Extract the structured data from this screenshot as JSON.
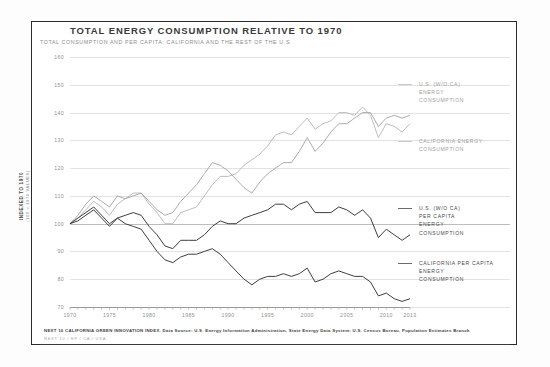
{
  "chart_data": {
    "type": "line",
    "title": "TOTAL ENERGY CONSUMPTION RELATIVE TO 1970",
    "subtitle": "TOTAL CONSUMPTION AND PER CAPITA: CALIFORNIA AND THE REST OF THE U.S.",
    "xlabel": "",
    "ylabel": "INDEXED TO 1970",
    "ylabel_sub": "(100 = 1970 VALUES)",
    "grid": true,
    "legend_position": "right",
    "xlim": [
      1970,
      2013
    ],
    "ylim": [
      70,
      160
    ],
    "yticks": [
      160,
      150,
      140,
      130,
      120,
      110,
      100,
      90,
      80,
      70
    ],
    "xticks": [
      1970,
      1975,
      1980,
      1985,
      1990,
      1995,
      2000,
      2005,
      2010,
      2013
    ],
    "x": [
      1970,
      1971,
      1972,
      1973,
      1974,
      1975,
      1976,
      1977,
      1978,
      1979,
      1980,
      1981,
      1982,
      1983,
      1984,
      1985,
      1986,
      1987,
      1988,
      1989,
      1990,
      1991,
      1992,
      1993,
      1994,
      1995,
      1996,
      1997,
      1998,
      1999,
      2000,
      2001,
      2002,
      2003,
      2004,
      2005,
      2006,
      2007,
      2008,
      2009,
      2010,
      2011,
      2012,
      2013
    ],
    "series": [
      {
        "name": "U.S. (W/O CA) ENERGY CONSUMPTION",
        "color": "#b5b5b5",
        "values": [
          100,
          102,
          105,
          108,
          106,
          103,
          107,
          109,
          111,
          111,
          107,
          104,
          100,
          100,
          104,
          105,
          106,
          110,
          114,
          117,
          117,
          118,
          121,
          123,
          125,
          128,
          132,
          133,
          132,
          135,
          138,
          134,
          136,
          137,
          140,
          140,
          139,
          142,
          139,
          131,
          136,
          135,
          133,
          136
        ]
      },
      {
        "name": "CALIFORNIA ENERGY CONSUMPTION",
        "color": "#a3a3a3",
        "values": [
          100,
          103,
          107,
          110,
          108,
          106,
          110,
          109,
          110,
          111,
          108,
          105,
          103,
          104,
          108,
          111,
          114,
          118,
          122,
          121,
          119,
          116,
          113,
          111,
          115,
          118,
          120,
          122,
          122,
          126,
          131,
          126,
          129,
          133,
          136,
          136,
          138,
          140,
          140,
          135,
          138,
          139,
          138,
          139
        ]
      },
      {
        "name": "U.S. (W/O CA) PER CAPITA ENERGY CONSUMPTION",
        "color": "#3e3e3e",
        "values": [
          100,
          101,
          103,
          105,
          102,
          99,
          102,
          103,
          104,
          103,
          99,
          96,
          92,
          91,
          94,
          94,
          94,
          96,
          99,
          101,
          100,
          100,
          102,
          103,
          104,
          105,
          107,
          107,
          105,
          107,
          108,
          104,
          104,
          104,
          106,
          105,
          103,
          105,
          102,
          95,
          98,
          96,
          94,
          96
        ]
      },
      {
        "name": "CALIFORNIA PER CAPITA ENERGY CONSUMPTION",
        "color": "#3e3e3e",
        "values": [
          100,
          102,
          104,
          106,
          103,
          100,
          102,
          100,
          99,
          98,
          94,
          90,
          87,
          86,
          88,
          89,
          89,
          90,
          91,
          89,
          86,
          83,
          80,
          78,
          80,
          81,
          81,
          82,
          81,
          82,
          84,
          79,
          80,
          82,
          83,
          82,
          81,
          81,
          79,
          74,
          75,
          73,
          72,
          73
        ]
      }
    ],
    "annotations": [
      {
        "text": "U.S. (W/O CA)\nENERGY\nCONSUMPTION",
        "tone": "light"
      },
      {
        "text": "CALIFORNIA ENERGY\nCONSUMPTION",
        "tone": "light"
      },
      {
        "text": "U.S. (W/O CA)\nPER CAPITA\nENERGY\nCONSUMPTION",
        "tone": "dark"
      },
      {
        "text": "CALIFORNIA PER CAPITA\nENERGY\nCONSUMPTION",
        "tone": "dark"
      }
    ]
  },
  "footer": {
    "source": "NEXT 10 CALIFORNIA GREEN INNOVATION INDEX. Data Source: U.S. Energy Information Administration, State Energy Data System; U.S. Census Bureau, Population Estimates Branch",
    "credit": "NEXT 10  /  EF  /  CA  /  USA"
  }
}
